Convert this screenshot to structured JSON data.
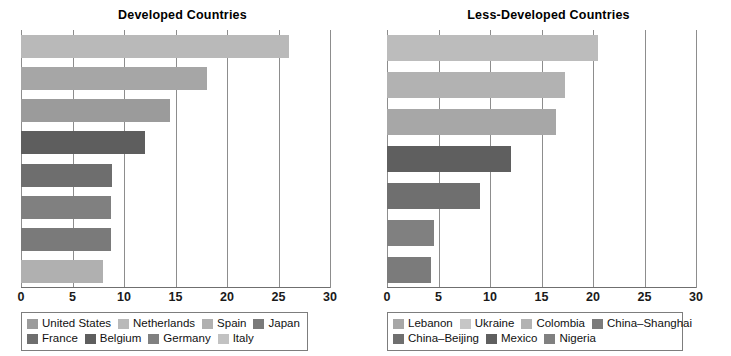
{
  "chart_data": [
    {
      "type": "bar",
      "title": "Developed Countries",
      "orientation": "horizontal",
      "xlabel": "",
      "ylabel": "",
      "xlim": [
        0,
        30
      ],
      "xticks": [
        "0",
        "5",
        "10",
        "15",
        "20",
        "25",
        "30"
      ],
      "grid": true,
      "legend_position": "bottom",
      "categories": [
        "United States",
        "Netherlands",
        "Spain",
        "Japan",
        "France",
        "Belgium",
        "Germany",
        "Italy"
      ],
      "values": [
        26.0,
        18.1,
        14.5,
        12.0,
        8.8,
        8.7,
        8.7,
        8.0
      ],
      "colors": [
        "#b9b9b9",
        "#a6a6a6",
        "#9b9b9b",
        "#5e5e5e",
        "#6e6e6e",
        "#808080",
        "#7a7a7a",
        "#b0b0b0"
      ]
    },
    {
      "type": "bar",
      "title": "Less-Developed Countries",
      "orientation": "horizontal",
      "xlabel": "",
      "ylabel": "",
      "xlim": [
        0,
        30
      ],
      "xticks": [
        "0",
        "5",
        "10",
        "15",
        "20",
        "25",
        "30"
      ],
      "grid": true,
      "legend_position": "bottom",
      "categories": [
        "Lebanon",
        "Ukraine",
        "Colombia",
        "China–Shanghai",
        "China–Beijing",
        "Mexico",
        "Nigeria"
      ],
      "values": [
        20.5,
        17.3,
        16.4,
        12.0,
        9.0,
        4.6,
        4.3
      ],
      "colors": [
        "#bcbcbc",
        "#b2b2b2",
        "#a7a7a7",
        "#5f5f5f",
        "#6f6f6f",
        "#808080",
        "#7b7b7b"
      ]
    }
  ],
  "left": {
    "title": "Developed Countries",
    "xticks": [
      {
        "label": "0",
        "value": 0
      },
      {
        "label": "5",
        "value": 5
      },
      {
        "label": "10",
        "value": 10
      },
      {
        "label": "15",
        "value": 15
      },
      {
        "label": "20",
        "value": 20
      },
      {
        "label": "25",
        "value": 25
      },
      {
        "label": "30",
        "value": 30
      }
    ],
    "bars": [
      {
        "label": "United States",
        "value": 26.0,
        "color": "#b9b9b9"
      },
      {
        "label": "Netherlands",
        "value": 18.1,
        "color": "#a6a6a6"
      },
      {
        "label": "Spain",
        "value": 14.5,
        "color": "#9b9b9b"
      },
      {
        "label": "Japan",
        "value": 12.0,
        "color": "#5e5e5e"
      },
      {
        "label": "France",
        "value": 8.8,
        "color": "#6e6e6e"
      },
      {
        "label": "Belgium",
        "value": 8.7,
        "color": "#808080"
      },
      {
        "label": "Germany",
        "value": 8.7,
        "color": "#7a7a7a"
      },
      {
        "label": "Italy",
        "value": 8.0,
        "color": "#b0b0b0"
      }
    ],
    "legend_rows": [
      [
        {
          "label": "United States",
          "color": "#9b9b9b"
        },
        {
          "label": "Netherlands",
          "color": "#b9b9b9"
        },
        {
          "label": "Spain",
          "color": "#b0b0b0"
        },
        {
          "label": "Japan",
          "color": "#7a7a7a"
        }
      ],
      [
        {
          "label": "France",
          "color": "#6e6e6e"
        },
        {
          "label": "Belgium",
          "color": "#5e5e5e"
        },
        {
          "label": "Germany",
          "color": "#808080"
        },
        {
          "label": "Italy",
          "color": "#c2c2c2"
        }
      ]
    ]
  },
  "right": {
    "title": "Less-Developed Countries",
    "xticks": [
      {
        "label": "0",
        "value": 0
      },
      {
        "label": "5",
        "value": 5
      },
      {
        "label": "10",
        "value": 10
      },
      {
        "label": "15",
        "value": 15
      },
      {
        "label": "20",
        "value": 20
      },
      {
        "label": "25",
        "value": 25
      },
      {
        "label": "30",
        "value": 30
      }
    ],
    "bars": [
      {
        "label": "Lebanon",
        "value": 20.5,
        "color": "#bcbcbc"
      },
      {
        "label": "Ukraine",
        "value": 17.3,
        "color": "#b2b2b2"
      },
      {
        "label": "Colombia",
        "value": 16.4,
        "color": "#a7a7a7"
      },
      {
        "label": "China–Shanghai",
        "value": 12.0,
        "color": "#5f5f5f"
      },
      {
        "label": "China–Beijing",
        "value": 9.0,
        "color": "#6f6f6f"
      },
      {
        "label": "Mexico",
        "value": 4.6,
        "color": "#808080"
      },
      {
        "label": "Nigeria",
        "value": 4.3,
        "color": "#7b7b7b"
      }
    ],
    "legend_rows": [
      [
        {
          "label": "Lebanon",
          "color": "#a7a7a7"
        },
        {
          "label": "Ukraine",
          "color": "#c6c6c6"
        },
        {
          "label": "Colombia",
          "color": "#b2b2b2"
        },
        {
          "label": "China–Shanghai",
          "color": "#7b7b7b"
        }
      ],
      [
        {
          "label": "China–Beijing",
          "color": "#6f6f6f"
        },
        {
          "label": "Mexico",
          "color": "#5f5f5f"
        },
        {
          "label": "Nigeria",
          "color": "#808080"
        }
      ]
    ]
  }
}
